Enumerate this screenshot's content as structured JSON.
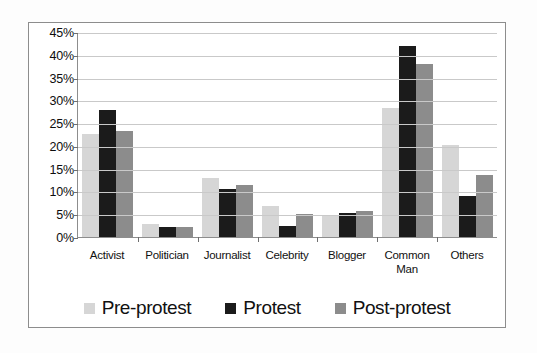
{
  "chart_data": {
    "type": "bar",
    "title": "",
    "xlabel": "",
    "ylabel": "",
    "ylim": [
      0,
      45
    ],
    "grid": true,
    "legend_position": "bottom",
    "y_ticks": [
      "0%",
      "5%",
      "10%",
      "15%",
      "20%",
      "25%",
      "30%",
      "35%",
      "40%",
      "45%"
    ],
    "y_tick_values": [
      0,
      5,
      10,
      15,
      20,
      25,
      30,
      35,
      40,
      45
    ],
    "categories": [
      "Activist",
      "Politician",
      "Journalist",
      "Celebrity",
      "Blogger",
      "Common Man",
      "Others"
    ],
    "category_lines": [
      [
        "Activist"
      ],
      [
        "Politician"
      ],
      [
        "Journalist"
      ],
      [
        "Celebrity"
      ],
      [
        "Blogger"
      ],
      [
        "Common",
        "Man"
      ],
      [
        "Others"
      ]
    ],
    "series": [
      {
        "name": "Pre-protest",
        "color": "#d6d6d6",
        "values": [
          22.7,
          2.8,
          13.0,
          6.8,
          4.8,
          28.3,
          20.1
        ]
      },
      {
        "name": "Protest",
        "color": "#1b1b1b",
        "values": [
          27.8,
          2.3,
          10.6,
          2.4,
          5.2,
          42.0,
          9.1
        ]
      },
      {
        "name": "Post-protest",
        "color": "#8c8c8c",
        "values": [
          23.2,
          2.3,
          11.4,
          5.0,
          5.7,
          37.9,
          13.7
        ]
      }
    ]
  }
}
